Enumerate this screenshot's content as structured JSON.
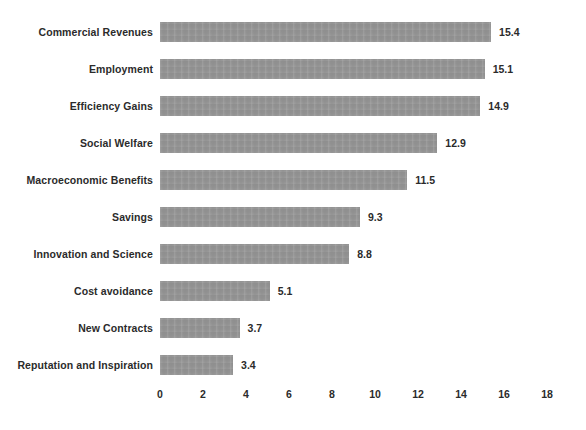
{
  "chart_data": {
    "type": "bar",
    "orientation": "horizontal",
    "title": "",
    "subtitle": "",
    "xlabel": "",
    "ylabel": "",
    "xlim": [
      0,
      18
    ],
    "xticks": [
      0,
      2,
      4,
      6,
      8,
      10,
      12,
      14,
      16,
      18
    ],
    "grid": false,
    "legend": false,
    "bar_color": "#939393",
    "text_color": "#2b2b2b",
    "background": "#ffffff",
    "categories": [
      "Commercial Revenues",
      "Employment",
      "Efficiency Gains",
      "Social Welfare",
      "Macroeconomic Benefits",
      "Savings",
      "Innovation and Science",
      "Cost avoidance",
      "New Contracts",
      "Reputation and Inspiration"
    ],
    "values": [
      15.4,
      15.1,
      14.9,
      12.9,
      11.5,
      9.3,
      8.8,
      5.1,
      3.7,
      3.4
    ],
    "value_labels": [
      "15.4",
      "15.1",
      "14.9",
      "12.9",
      "11.5",
      "9.3",
      "8.8",
      "5.1",
      "3.7",
      "3.4"
    ],
    "tick_labels": [
      "0",
      "2",
      "4",
      "6",
      "8",
      "10",
      "12",
      "14",
      "16",
      "18"
    ]
  }
}
